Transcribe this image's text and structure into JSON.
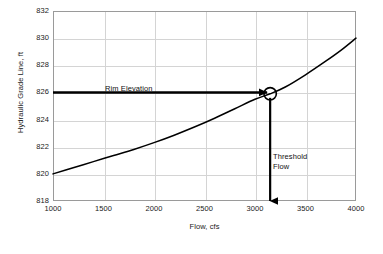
{
  "chart_data": {
    "type": "line",
    "title": "",
    "xlabel": "Flow, cfs",
    "ylabel": "Hydraulic Grade Line, ft",
    "xlim": [
      1000,
      4000
    ],
    "ylim": [
      818,
      832
    ],
    "xticks": [
      1000,
      1500,
      2000,
      2500,
      3000,
      3500,
      4000
    ],
    "yticks": [
      818,
      820,
      822,
      824,
      826,
      828,
      830,
      832
    ],
    "xtick_labels": [
      "1000",
      "1500",
      "2000",
      "2500",
      "3000",
      "3500",
      "4000"
    ],
    "ytick_labels": [
      "818",
      "820",
      "822",
      "824",
      "826",
      "828",
      "830",
      "832"
    ],
    "grid": true,
    "legend": "none",
    "series": [
      {
        "name": "Hydraulic Grade Line",
        "color": "#000000",
        "x": [
          1000,
          1200,
          1400,
          1600,
          1800,
          2000,
          2200,
          2400,
          2600,
          2800,
          3000,
          3150,
          3300,
          3500,
          3700,
          3850,
          4000
        ],
        "y": [
          820.0,
          820.45,
          820.9,
          821.35,
          821.8,
          822.3,
          822.85,
          823.45,
          824.1,
          824.8,
          825.5,
          825.9,
          826.4,
          827.3,
          828.3,
          829.1,
          830.0
        ]
      }
    ],
    "markers": [
      {
        "name": "threshold-point",
        "shape": "circle-open",
        "x": 3150,
        "y": 825.9
      }
    ],
    "annotations": [
      {
        "name": "rim-elevation",
        "text": "Rim Elevation",
        "arrow": "horizontal-right",
        "from_x": 1000,
        "to_x": 3120,
        "y": 826.0
      },
      {
        "name": "threshold-flow",
        "text": "Threshold\nFlow",
        "arrow": "vertical-down",
        "x": 3150,
        "from_y": 825.6,
        "to_y": 818.0
      }
    ],
    "colors": {
      "curve": "#000000",
      "arrow": "#000000",
      "grid": "#d4d4d4",
      "frame": "#9a9a9a",
      "background": "#ffffff",
      "text": "#1a1a1a"
    }
  }
}
